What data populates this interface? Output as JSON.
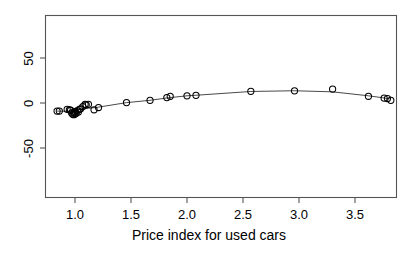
{
  "figure": {
    "background_color": "#ffffff",
    "frame_color": "#555555",
    "point_color": "#000000",
    "line_color": "#333333",
    "width": 418,
    "height": 261
  },
  "axes": {
    "x_title": "Price index for used cars",
    "y_title": "",
    "x_ticks": [
      "1.0",
      "1.5",
      "2.0",
      "2.5",
      "3.0",
      "3.5"
    ],
    "y_ticks": [
      "50",
      "0",
      "-50"
    ]
  },
  "chart_data": {
    "type": "scatter",
    "title": "",
    "subtitle": "",
    "xlabel": "Price index for used cars",
    "ylabel": "",
    "xlim": [
      0.73,
      3.86
    ],
    "ylim": [
      -86,
      82
    ],
    "x_ticks": [
      1.0,
      1.5,
      2.0,
      2.5,
      3.0,
      3.5
    ],
    "y_ticks": [
      -50,
      0,
      50
    ],
    "grid": false,
    "legend": null,
    "frame": "box",
    "series": [
      {
        "name": "observations",
        "marker": "open-circle",
        "x": [
          0.84,
          0.86,
          0.93,
          0.95,
          0.96,
          0.97,
          0.98,
          0.99,
          0.99,
          1.0,
          1.0,
          1.01,
          1.02,
          1.03,
          1.04,
          1.05,
          1.07,
          1.09,
          1.1,
          1.12,
          1.17,
          1.21,
          1.46,
          1.67,
          1.82,
          1.85,
          2.0,
          2.08,
          2.57,
          2.96,
          3.3,
          3.62,
          3.76,
          3.79,
          3.82
        ],
        "y": [
          -9.0,
          -9.0,
          -7.0,
          -7.5,
          -8.0,
          -11.0,
          -12.5,
          -13.0,
          -10.5,
          -12.0,
          -9.5,
          -11.5,
          -8.5,
          -10.0,
          -7.0,
          -6.5,
          -4.0,
          -1.5,
          -2.0,
          -1.5,
          -7.5,
          -5.0,
          0.5,
          3.0,
          6.0,
          7.5,
          8.0,
          8.5,
          13.0,
          13.5,
          15.5,
          7.5,
          5.5,
          5.0,
          3.0
        ]
      },
      {
        "name": "fitted-curve",
        "marker": "none",
        "x": [
          0.84,
          0.95,
          1.05,
          1.17,
          1.21,
          1.46,
          1.67,
          1.82,
          1.85,
          2.0,
          2.08,
          2.57,
          2.96,
          3.3,
          3.62,
          3.76,
          3.82
        ],
        "y": [
          -9.0,
          -9.3,
          -6.6,
          -5.2,
          -4.6,
          0.4,
          3.0,
          5.6,
          6.0,
          8.0,
          8.6,
          12.8,
          13.6,
          12.4,
          8.0,
          5.6,
          4.4
        ]
      }
    ]
  }
}
